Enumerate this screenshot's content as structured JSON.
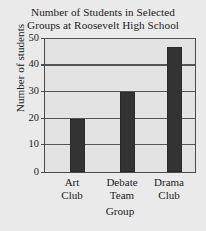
{
  "chart_data": {
    "type": "bar",
    "title": "Number of Students in Selected Groups at Roosevelt High School",
    "title_lines": [
      "Number of Students in Selected",
      "Groups at Roosevelt High School"
    ],
    "categories": [
      "Art Club",
      "Debate Team",
      "Drama Club"
    ],
    "category_lines": [
      [
        "Art",
        "Club"
      ],
      [
        "Debate",
        "Team"
      ],
      [
        "Drama",
        "Club"
      ]
    ],
    "values": [
      20,
      30,
      47
    ],
    "xlabel": "Group",
    "ylabel": "Number of students",
    "ylim": [
      0,
      50
    ],
    "yticks": [
      0,
      10,
      20,
      30,
      40,
      50
    ],
    "ytick_labels": [
      "0",
      "10",
      "20",
      "30",
      "40",
      "50"
    ],
    "grid": true,
    "legend": false,
    "colors": {
      "bar_fill": "#333333",
      "plot_background": "#e3e3e3",
      "page_background": "#eaeaea",
      "axis": "#4a4a4a",
      "gridline": "#555555",
      "text": "#1a1a1a"
    }
  }
}
